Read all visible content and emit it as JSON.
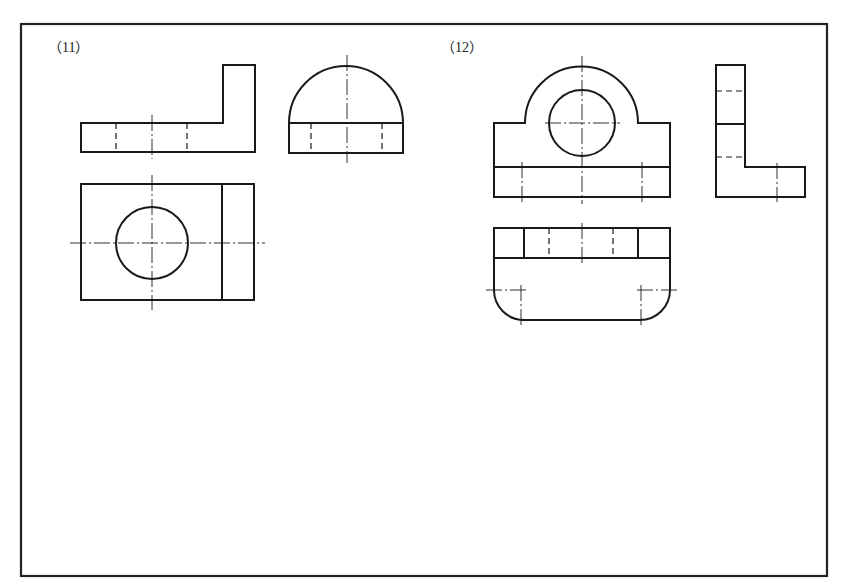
{
  "problems": [
    {
      "id": "problem-11",
      "label": "（11）",
      "views": [
        "front-view",
        "side-view",
        "top-view"
      ]
    },
    {
      "id": "problem-12",
      "label": "（12）",
      "views": [
        "front-view",
        "side-view",
        "top-view"
      ]
    }
  ],
  "colors": {
    "line": "#1a1a1a",
    "frame": "#222222",
    "background": "#ffffff"
  }
}
